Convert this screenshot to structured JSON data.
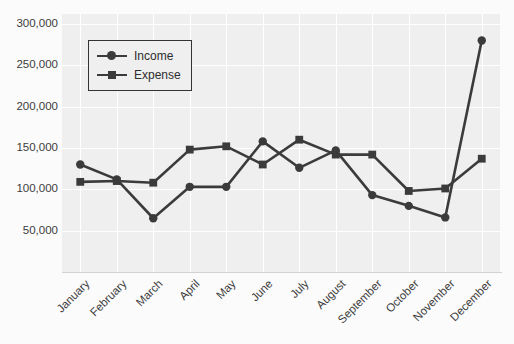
{
  "chart_data": {
    "type": "line",
    "title": "",
    "xlabel": "",
    "ylabel": "",
    "categories": [
      "January",
      "February",
      "March",
      "April",
      "May",
      "June",
      "July",
      "August",
      "September",
      "October",
      "November",
      "December"
    ],
    "series": [
      {
        "name": "Income",
        "marker": "circle",
        "color": "#3b3b3b",
        "values": [
          130000,
          112000,
          65000,
          103000,
          103000,
          158000,
          126000,
          147000,
          93000,
          80000,
          66000,
          280000
        ]
      },
      {
        "name": "Expense",
        "marker": "square",
        "color": "#3b3b3b",
        "values": [
          109000,
          110000,
          108000,
          148000,
          152000,
          130000,
          160000,
          142000,
          142000,
          98000,
          101000,
          137000
        ]
      }
    ],
    "ylim": [
      0,
      312000
    ],
    "yticks": [
      50000,
      100000,
      150000,
      200000,
      250000,
      300000
    ],
    "ytick_labels": [
      "50,000",
      "100,000",
      "150,000",
      "200,000",
      "250,000",
      "300,000"
    ],
    "grid": true,
    "legend_position": "upper-left",
    "legend_entries": [
      "Income",
      "Expense"
    ],
    "plot_background": "#efefef",
    "gridline_color": "#ffffff"
  }
}
